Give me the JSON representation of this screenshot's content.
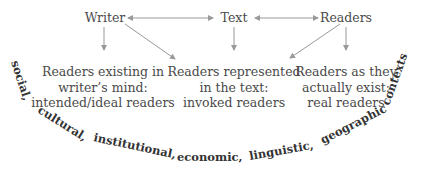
{
  "nodes": {
    "writer": "Writer",
    "text": "Text",
    "readers": "Readers"
  },
  "descriptions": {
    "left": [
      "Readers existing in",
      "writer’s mind:",
      "intended/ideal readers"
    ],
    "middle": [
      "Readers represented",
      "in the text:",
      "invoked readers"
    ],
    "right": [
      "Readers as they",
      "actually exist:",
      "real readers"
    ]
  },
  "contexts": [
    "social,",
    "cultural,",
    "institutional,",
    "economic,",
    "linguistic,",
    "geographic",
    "contexts"
  ],
  "colors": {
    "text": "#4a4a4a",
    "arrow": "#999999",
    "context": "#333333"
  }
}
